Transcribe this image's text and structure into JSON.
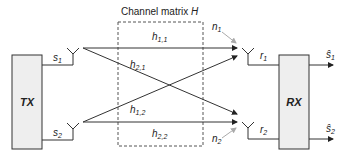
{
  "diagram": {
    "title_prefix": "Channel matrix ",
    "title_var": "H",
    "transmitter": {
      "label": "TX"
    },
    "receiver": {
      "label": "RX"
    },
    "inputs": [
      {
        "sym": "s",
        "sub": "1"
      },
      {
        "sym": "s",
        "sub": "2"
      }
    ],
    "outputs": [
      {
        "sym": "ŝ",
        "sub": "1"
      },
      {
        "sym": "ŝ",
        "sub": "2"
      }
    ],
    "received": [
      {
        "sym": "r",
        "sub": "1"
      },
      {
        "sym": "r",
        "sub": "2"
      }
    ],
    "noise": [
      {
        "sym": "n",
        "sub": "1"
      },
      {
        "sym": "n",
        "sub": "2"
      }
    ],
    "channels": [
      {
        "sym": "h",
        "sub": "1,1"
      },
      {
        "sym": "h",
        "sub": "2,1"
      },
      {
        "sym": "h",
        "sub": "1,2"
      },
      {
        "sym": "h",
        "sub": "2,2"
      }
    ],
    "colors": {
      "box_fill": "#eeeeee",
      "line": "#333333",
      "noise_arrow": "#aaaaaa"
    }
  }
}
